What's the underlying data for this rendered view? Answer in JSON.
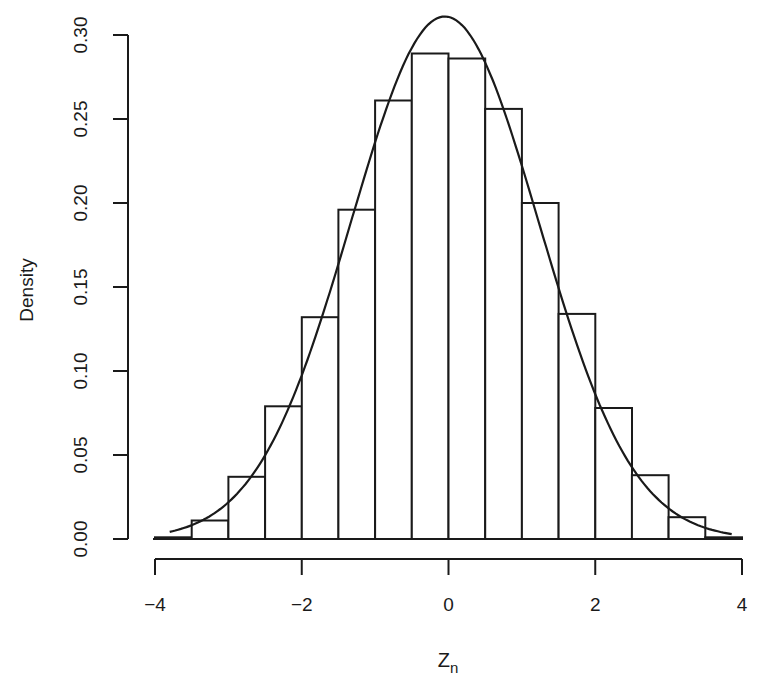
{
  "chart_data": {
    "type": "bar",
    "subtype": "histogram_with_density_curve",
    "title": "",
    "xlabel": "Z",
    "xlabel_subscript": "n",
    "ylabel": "Density",
    "xlim": [
      -4,
      4
    ],
    "ylim": [
      0,
      0.3
    ],
    "x_ticks": [
      -4,
      -2,
      0,
      2,
      4
    ],
    "x_tick_labels": [
      "−4",
      "−2",
      "0",
      "2",
      "4"
    ],
    "y_ticks": [
      0.0,
      0.05,
      0.1,
      0.15,
      0.2,
      0.25,
      0.3
    ],
    "y_tick_labels": [
      "0.00",
      "0.05",
      "0.10",
      "0.15",
      "0.20",
      "0.25",
      "0.30"
    ],
    "grid": false,
    "legend": null,
    "bin_width": 0.5,
    "bins": [
      {
        "x0": -4.0,
        "x1": -3.5,
        "density": 0.001
      },
      {
        "x0": -3.5,
        "x1": -3.0,
        "density": 0.011
      },
      {
        "x0": -3.0,
        "x1": -2.5,
        "density": 0.037
      },
      {
        "x0": -2.5,
        "x1": -2.0,
        "density": 0.079
      },
      {
        "x0": -2.0,
        "x1": -1.5,
        "density": 0.132
      },
      {
        "x0": -1.5,
        "x1": -1.0,
        "density": 0.196
      },
      {
        "x0": -1.0,
        "x1": -0.5,
        "density": 0.261
      },
      {
        "x0": -0.5,
        "x1": 0.0,
        "density": 0.289
      },
      {
        "x0": 0.0,
        "x1": 0.5,
        "density": 0.286
      },
      {
        "x0": 0.5,
        "x1": 1.0,
        "density": 0.256
      },
      {
        "x0": 1.0,
        "x1": 1.5,
        "density": 0.2
      },
      {
        "x0": 1.5,
        "x1": 2.0,
        "density": 0.134
      },
      {
        "x0": 2.0,
        "x1": 2.5,
        "density": 0.078
      },
      {
        "x0": 2.5,
        "x1": 3.0,
        "density": 0.038
      },
      {
        "x0": 3.0,
        "x1": 3.5,
        "density": 0.013
      },
      {
        "x0": 3.5,
        "x1": 4.0,
        "density": 0.001
      }
    ],
    "curve": {
      "type": "normal_density",
      "mean": -0.05,
      "sd": 1.28,
      "peak": 0.311,
      "x_range": [
        -3.8,
        3.86
      ]
    },
    "colors": {
      "bar_fill": "#ffffff",
      "bar_stroke": "#1a1a1a",
      "curve": "#1a1a1a",
      "axis": "#1a1a1a"
    }
  }
}
